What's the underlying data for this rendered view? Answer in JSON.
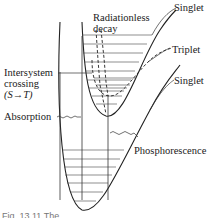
{
  "diagram": {
    "labels": {
      "singlet_upper": "Singlet",
      "triplet": "Triplet",
      "singlet_ground": "Singlet",
      "radiationless_line1": "Radiationless",
      "radiationless_line2": "decay",
      "isc_line1": "Intersystem",
      "isc_line2": "crossing",
      "isc_line3": "(S→T)",
      "absorption": "Absorption",
      "phosphorescence": "Phosphorescence"
    },
    "caption": "Fig. 13.11  The",
    "states": [
      {
        "name": "Singlet (excited)",
        "role": "upper curve"
      },
      {
        "name": "Triplet",
        "role": "middle curve"
      },
      {
        "name": "Singlet (ground)",
        "role": "lower curve"
      }
    ],
    "processes": [
      "Absorption",
      "Radiationless decay",
      "Intersystem crossing (S→T)",
      "Phosphorescence"
    ],
    "colors": {
      "ink": "#222222",
      "background": "#ffffff"
    }
  }
}
